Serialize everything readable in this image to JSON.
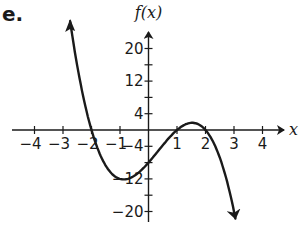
{
  "problem_label": "e.",
  "chart_data": {
    "type": "line",
    "title": "",
    "function": "f(x) = -2(x+2)(x-1)(x-2)",
    "xlabel": "x",
    "ylabel": "f(x)",
    "xlim": [
      -4.5,
      4.8
    ],
    "ylim": [
      -24,
      26
    ],
    "x_ticks": [
      -4,
      -3,
      -2,
      -1,
      1,
      2,
      3,
      4
    ],
    "x_tick_labels": [
      "−4",
      "−3",
      "−2",
      "−1",
      "1",
      "2",
      "3",
      "4"
    ],
    "y_ticks": [
      -20,
      -16,
      -12,
      -8,
      -4,
      4,
      8,
      12,
      16,
      20
    ],
    "y_tick_labels_shown": {
      "20": "20",
      "12": "12",
      "4": "4",
      "-4": "−4",
      "-12": "−12",
      "-20": "−20"
    },
    "grid": false,
    "legend": null,
    "key_points": [
      {
        "x": -2,
        "y": 0,
        "note": "root"
      },
      {
        "x": 0,
        "y": -8,
        "note": "y-intercept"
      },
      {
        "x": 1,
        "y": 0,
        "note": "root"
      },
      {
        "x": 2,
        "y": 0,
        "note": "root"
      },
      {
        "x": -0.9,
        "y": -12.2,
        "note": "local minimum (approx)"
      },
      {
        "x": 1.5,
        "y": 0.9,
        "note": "local maximum (approx)"
      }
    ],
    "end_behavior": {
      "left": "up arrow toward +infinity",
      "right": "down arrow toward -infinity"
    },
    "series": [
      {
        "name": "f(x)",
        "x": [
          -2.75,
          -2.5,
          -2.25,
          -2,
          -1.75,
          -1.5,
          -1.25,
          -1,
          -0.75,
          -0.5,
          -0.25,
          0,
          0.25,
          0.5,
          0.75,
          1,
          1.25,
          1.5,
          1.75,
          2,
          2.25,
          2.5,
          2.75,
          3.05
        ],
        "values": [
          17.1,
          7.9,
          2.2,
          0,
          -2.2,
          -6.1,
          -9.8,
          -12.0,
          -12.9,
          -12.4,
          -10.7,
          -8.0,
          -6.0,
          -3.8,
          -1.9,
          0,
          0.9,
          0.9,
          0.3,
          0,
          -2.2,
          -6.8,
          -14.4,
          -26.9
        ]
      }
    ]
  }
}
